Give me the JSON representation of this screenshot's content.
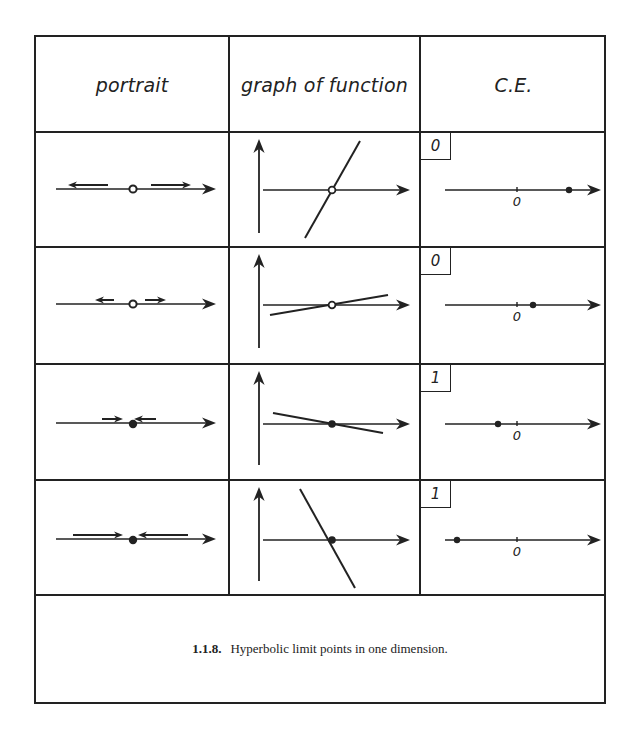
{
  "figure": {
    "headers": [
      "portrait",
      "graph of function",
      "C.E."
    ],
    "caption": {
      "number": "1.1.8.",
      "text": "Hyperbolic limit points in one dimension."
    },
    "rows": [
      {
        "fixed_point": "open",
        "stability": "repelling",
        "portrait": {
          "flow_arrows": [
            {
              "x1": 72,
              "x2": 35,
              "dir": "left"
            },
            {
              "x1": 115,
              "x2": 152,
              "dir": "right"
            }
          ]
        },
        "graph": {
          "slope": "steep-positive",
          "line": [
            [
              75,
              105
            ],
            [
              130,
              8
            ]
          ]
        },
        "ce": {
          "index": "0",
          "zero_label": "0",
          "dot_offset": 52
        }
      },
      {
        "fixed_point": "open",
        "stability": "repelling",
        "portrait": {
          "flow_arrows": [
            {
              "x1": 78,
              "x2": 62,
              "dir": "left"
            },
            {
              "x1": 109,
              "x2": 127,
              "dir": "right"
            }
          ]
        },
        "graph": {
          "slope": "shallow-positive",
          "line": [
            [
              40,
              67
            ],
            [
              158,
              47
            ]
          ]
        },
        "ce": {
          "index": "0",
          "zero_label": "0",
          "dot_offset": 16
        }
      },
      {
        "fixed_point": "filled",
        "stability": "attracting",
        "portrait": {
          "flow_arrows": [
            {
              "x1": 66,
              "x2": 84,
              "dir": "right"
            },
            {
              "x1": 120,
              "x2": 101,
              "dir": "left"
            }
          ]
        },
        "graph": {
          "slope": "shallow-negative",
          "line": [
            [
              43,
              48
            ],
            [
              153,
              68
            ]
          ]
        },
        "ce": {
          "index": "1",
          "zero_label": "0",
          "dot_offset": -19
        }
      },
      {
        "fixed_point": "filled",
        "stability": "attracting",
        "portrait": {
          "flow_arrows": [
            {
              "x1": 37,
              "x2": 84,
              "dir": "right"
            },
            {
              "x1": 152,
              "x2": 105,
              "dir": "left"
            }
          ]
        },
        "graph": {
          "slope": "steep-negative",
          "line": [
            [
              70,
              8
            ],
            [
              125,
              107
            ]
          ]
        },
        "ce": {
          "index": "1",
          "zero_label": "0",
          "dot_offset": -60
        }
      }
    ]
  }
}
